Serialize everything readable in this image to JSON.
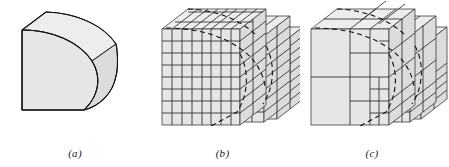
{
  "figure": {
    "background_color": "#ffffff",
    "line_color": "#1a1a1a",
    "fill_front": "#e6e6e6",
    "fill_top": "#ededed",
    "fill_side": "#dcdcdc",
    "dashed_color": "#111111"
  },
  "panels": [
    {
      "id": "a",
      "caption": "(a)",
      "description": "smooth quarter-cylinder solid",
      "mesh_type": "none",
      "front_grid": {
        "cols": 0,
        "rows": 0
      }
    },
    {
      "id": "b",
      "caption": "(b)",
      "description": "uniform voxel approximation of the solid",
      "mesh_type": "uniform",
      "front_grid": {
        "cols": 8,
        "rows": 8
      },
      "cell_count_across": 8,
      "step_levels": 3
    },
    {
      "id": "c",
      "caption": "(c)",
      "description": "adaptive octree mesh refined near the curved boundary",
      "mesh_type": "adaptive",
      "front_grid": {
        "cols": 4,
        "rows": 4
      },
      "refinement_levels": 3,
      "step_levels": 3
    }
  ],
  "geometry": {
    "projection": "oblique",
    "depth_dx": 26,
    "depth_dy": -20,
    "body_width": 86,
    "body_height": 92
  }
}
